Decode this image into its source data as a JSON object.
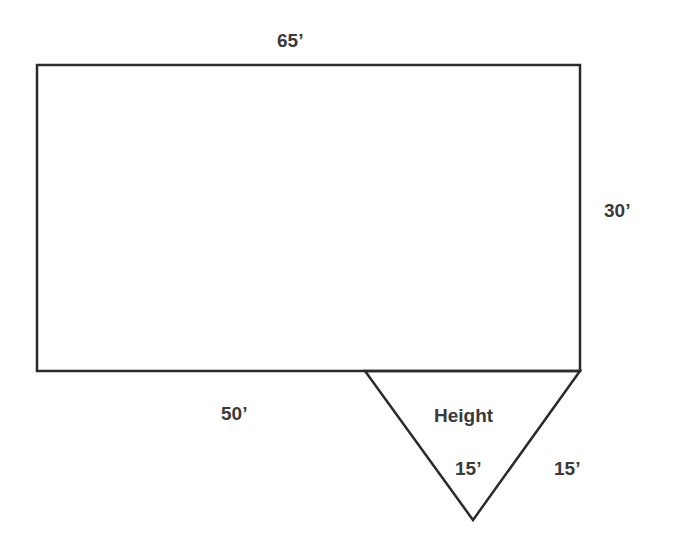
{
  "diagram": {
    "shapes": {
      "rectangle": {
        "x": 37,
        "y": 65,
        "w": 543,
        "h": 306
      },
      "triangle": {
        "points": "365,371 580,371 473,520"
      }
    },
    "labels": {
      "top_width": "65’",
      "right_height": "30’",
      "bottom_segment": "50’",
      "triangle_height_word": "Height",
      "triangle_height_value": "15’",
      "triangle_side": "15’"
    },
    "colors": {
      "stroke": "#2b2b2b",
      "text": "#3a3a3a",
      "background": "#ffffff"
    }
  }
}
